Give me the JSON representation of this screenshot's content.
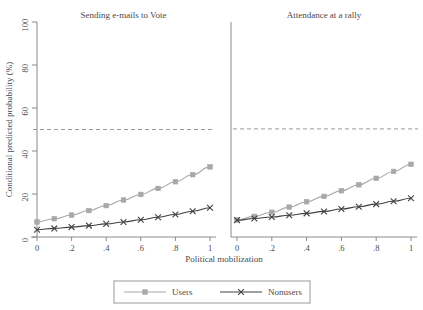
{
  "figure": {
    "background_color": "#ffffff",
    "axis_color": "#8a8a8a",
    "text_color": "#4a4a4a"
  },
  "chart_data": {
    "type": "line",
    "title": "",
    "xlabel": "Political mobilization",
    "ylabel": "Conditional predicted probability (%)",
    "xlim": [
      0,
      1
    ],
    "ylim": [
      0,
      100
    ],
    "xticks": [
      "0",
      ".2",
      ".4",
      ".6",
      ".8",
      "1"
    ],
    "xtick_values": [
      0,
      0.2,
      0.4,
      0.6,
      0.8,
      1
    ],
    "yticks": [
      "0",
      "20",
      "40",
      "60",
      "80",
      "100"
    ],
    "ytick_values": [
      0,
      20,
      40,
      60,
      80,
      100
    ],
    "grid": false,
    "legend_position": "bottom-center",
    "reference_line": {
      "orientation": "horizontal",
      "value": 50,
      "style": "dashed",
      "color": "#9a9a9a"
    },
    "legend": [
      {
        "name": "Users",
        "color": "#a8a8a8",
        "marker": "square"
      },
      {
        "name": "Nonusers",
        "color": "#404040",
        "marker": "x"
      }
    ],
    "panels": [
      {
        "title": "Sending e-mails to Vote",
        "x": [
          0,
          0.1,
          0.2,
          0.3,
          0.4,
          0.5,
          0.6,
          0.7,
          0.8,
          0.9,
          1
        ],
        "series": [
          {
            "name": "Users",
            "color": "#a8a8a8",
            "marker": "square",
            "values": [
              7.0,
              8.5,
              10.2,
              12.3,
              14.6,
              17.2,
              19.8,
              22.6,
              25.7,
              29.0,
              32.6
            ]
          },
          {
            "name": "Nonusers",
            "color": "#404040",
            "marker": "x",
            "values": [
              3.4,
              4.0,
              4.6,
              5.3,
              6.1,
              7.0,
              8.0,
              9.2,
              10.5,
              12.0,
              13.6
            ]
          }
        ]
      },
      {
        "title": "Attendance at a rally",
        "x": [
          0,
          0.1,
          0.2,
          0.3,
          0.4,
          0.5,
          0.6,
          0.7,
          0.8,
          0.9,
          1
        ],
        "series": [
          {
            "name": "Users",
            "color": "#a8a8a8",
            "marker": "square",
            "values": [
              8.0,
              9.6,
              11.5,
              13.9,
              16.4,
              18.9,
              21.5,
              24.3,
              27.3,
              30.5,
              33.8
            ]
          },
          {
            "name": "Nonusers",
            "color": "#404040",
            "marker": "x",
            "values": [
              7.8,
              8.6,
              9.3,
              10.1,
              11.0,
              11.9,
              13.0,
              14.1,
              15.3,
              16.6,
              18.0
            ]
          }
        ]
      }
    ]
  }
}
